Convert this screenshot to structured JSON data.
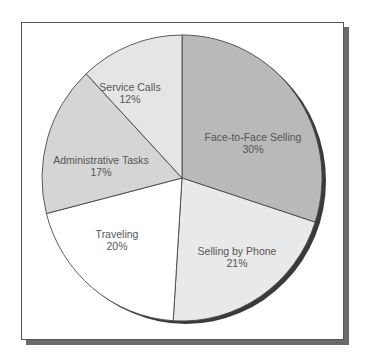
{
  "chart_data": {
    "type": "pie",
    "title": "",
    "start_angle_deg": 0,
    "direction": "clockwise",
    "categories": [
      "Face-to-Face Selling",
      "Selling by Phone",
      "Traveling",
      "Administrative Tasks",
      "Service Calls"
    ],
    "values": [
      30,
      21,
      20,
      17,
      12
    ],
    "unit": "%",
    "slices": [
      {
        "label": "Face-to-Face Selling",
        "value": 30,
        "display": "30%",
        "color": "#b9b9b9"
      },
      {
        "label": "Selling by Phone",
        "value": 21,
        "display": "21%",
        "color": "#e9e9e9"
      },
      {
        "label": "Traveling",
        "value": 20,
        "display": "20%",
        "color": "#ffffff"
      },
      {
        "label": "Administrative Tasks",
        "value": 17,
        "display": "17%",
        "color": "#d5d5d5"
      },
      {
        "label": "Service Calls",
        "value": 12,
        "display": "12%",
        "color": "#e5e5e5"
      }
    ],
    "legend": "none (labels inside slices)"
  },
  "labels": {
    "face_to_face": {
      "name": "Face-to-Face Selling",
      "pct": "30%"
    },
    "phone": {
      "name": "Selling by Phone",
      "pct": "21%"
    },
    "traveling": {
      "name": "Traveling",
      "pct": "20%"
    },
    "admin": {
      "name": "Administrative Tasks",
      "pct": "17%"
    },
    "service": {
      "name": "Service Calls",
      "pct": "12%"
    }
  }
}
